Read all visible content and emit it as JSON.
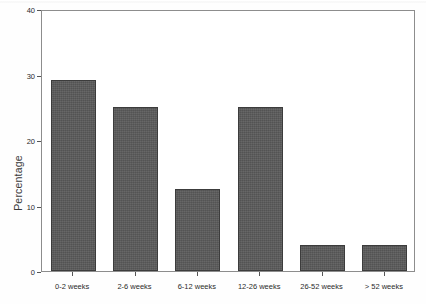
{
  "chart_data": {
    "type": "bar",
    "title": "",
    "xlabel": "",
    "ylabel": "Percentage",
    "categories": [
      "0-2 weeks",
      "2-6 weeks",
      "6-12 weeks",
      "12-26 weeks",
      "26-52 weeks",
      "> 52 weeks"
    ],
    "values": [
      29.2,
      25,
      12.5,
      25,
      4,
      4
    ],
    "ylim": [
      0,
      40
    ],
    "yticks": [
      0,
      10,
      20,
      30,
      40
    ],
    "ytick_labels": [
      "0",
      "10",
      "20",
      "30",
      "40"
    ],
    "grid": false,
    "legend": null,
    "bar_color": "#5a5a5a",
    "bar_edge_color": "#3c3c3c",
    "axis_color": "#8d8d8d",
    "background": "#ffffff"
  }
}
